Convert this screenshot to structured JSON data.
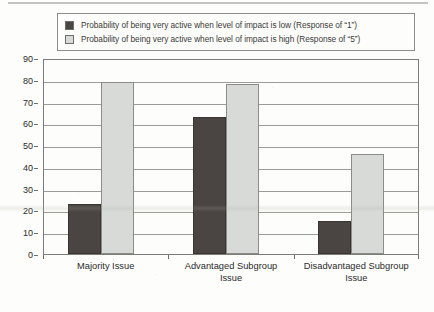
{
  "chart_data": {
    "type": "bar",
    "title": "",
    "xlabel": "",
    "ylabel": "",
    "ylim": [
      0,
      90
    ],
    "y_ticks": [
      0,
      10,
      20,
      30,
      40,
      50,
      60,
      70,
      80,
      90
    ],
    "grid": true,
    "legend_position": "top",
    "categories": [
      "Majority Issue",
      "Advantaged Subgroup Issue",
      "Disadvantaged Subgroup Issue"
    ],
    "series": [
      {
        "name": "Probability of being very active when level of impact is low (Response of “1”)",
        "color": "#4a4542",
        "values": [
          23,
          63,
          15
        ]
      },
      {
        "name": "Probability of being very active when level of impact is high (Response of “5”)",
        "color": "#d8dad7",
        "values": [
          79,
          78,
          46
        ]
      }
    ]
  },
  "legend": {
    "entries": [
      {
        "swatch": "dark",
        "label": "Probability of being very active when level of impact is low (Response of “1”)"
      },
      {
        "swatch": "light",
        "label": "Probability of being very active when level of impact is high (Response of “5”)"
      }
    ]
  },
  "x_axis": {
    "labels": [
      "Majority Issue",
      "Advantaged Subgroup\nIssue",
      "Disadvantaged Subgroup\nIssue"
    ]
  },
  "caption": {
    "text": ""
  },
  "colors": {
    "series_low": "#4a4542",
    "series_high": "#d8dad7",
    "gridline": "#9c9c96",
    "frame": "#7d7d77",
    "background": "#fdfdfb"
  }
}
